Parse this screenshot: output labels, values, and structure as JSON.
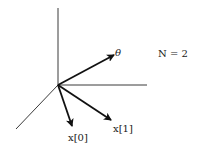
{
  "diagram": {
    "labels": {
      "theta": "θ",
      "n_equation": "N = 2",
      "x0": "x[0]",
      "x1": "x[1]"
    },
    "colors": {
      "axis": "#3a3a3a",
      "vector": "#111111",
      "text": "#1a1a1a",
      "background": "#ffffff"
    },
    "origin": [
      58,
      85
    ],
    "axes": [
      {
        "name": "vertical-axis",
        "from": [
          58,
          85
        ],
        "to": [
          58,
          8
        ]
      },
      {
        "name": "horizontal-axis",
        "from": [
          58,
          85
        ],
        "to": [
          147,
          85
        ]
      },
      {
        "name": "diagonal-axis",
        "from": [
          58,
          85
        ],
        "to": [
          16,
          129
        ]
      }
    ],
    "vectors": [
      {
        "name": "theta",
        "from": [
          58,
          85
        ],
        "to": [
          114,
          55
        ]
      },
      {
        "name": "x1",
        "from": [
          58,
          85
        ],
        "to": [
          111,
          120
        ]
      },
      {
        "name": "x0",
        "from": [
          58,
          85
        ],
        "to": [
          72,
          126
        ]
      }
    ]
  }
}
